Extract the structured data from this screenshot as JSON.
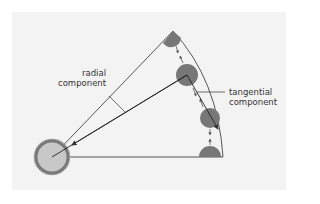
{
  "diagram": {
    "labels": {
      "radial_line1": "radial",
      "radial_line2": "component",
      "tangential_line1": "tangential",
      "tangential_line2": "component"
    },
    "colors": {
      "background": "#f3f3f3",
      "line": "#333333",
      "particle": "#777777",
      "hub_fill": "#c8c8c8",
      "hub_ring": "#7a7a7a"
    }
  }
}
